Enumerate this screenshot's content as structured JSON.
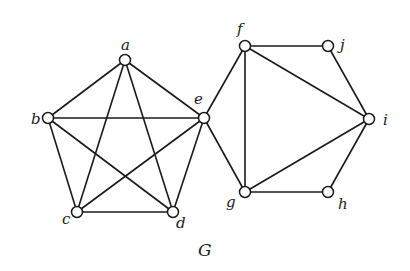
{
  "title": "G",
  "colors": {
    "edge": "#1a1a1a",
    "vertex_fill": "#ffffff",
    "vertex_stroke": "#1a1a1a",
    "label": "#222222"
  },
  "vertices": [
    {
      "id": "a",
      "label": "a",
      "x": 125,
      "y": 60,
      "lx": 121,
      "ly": 50
    },
    {
      "id": "b",
      "label": "b",
      "x": 48,
      "y": 118,
      "lx": 31,
      "ly": 124
    },
    {
      "id": "c",
      "label": "c",
      "x": 77,
      "y": 212,
      "lx": 62,
      "ly": 224
    },
    {
      "id": "d",
      "label": "d",
      "x": 173,
      "y": 212,
      "lx": 176,
      "ly": 228
    },
    {
      "id": "e",
      "label": "e",
      "x": 204,
      "y": 118,
      "lx": 194,
      "ly": 104
    },
    {
      "id": "f",
      "label": "f",
      "x": 245,
      "y": 46,
      "lx": 237,
      "ly": 34
    },
    {
      "id": "g",
      "label": "g",
      "x": 245,
      "y": 192,
      "lx": 226,
      "ly": 207
    },
    {
      "id": "h",
      "label": "h",
      "x": 328,
      "y": 192,
      "lx": 338,
      "ly": 209
    },
    {
      "id": "i",
      "label": "i",
      "x": 369,
      "y": 119,
      "lx": 383,
      "ly": 125
    },
    {
      "id": "j",
      "label": "j",
      "x": 328,
      "y": 46,
      "lx": 340,
      "ly": 50
    }
  ],
  "edges": [
    [
      "a",
      "b"
    ],
    [
      "a",
      "c"
    ],
    [
      "a",
      "d"
    ],
    [
      "a",
      "e"
    ],
    [
      "b",
      "c"
    ],
    [
      "b",
      "d"
    ],
    [
      "b",
      "e"
    ],
    [
      "c",
      "d"
    ],
    [
      "c",
      "e"
    ],
    [
      "d",
      "e"
    ],
    [
      "e",
      "f"
    ],
    [
      "e",
      "g"
    ],
    [
      "f",
      "g"
    ],
    [
      "f",
      "j"
    ],
    [
      "f",
      "i"
    ],
    [
      "g",
      "i"
    ],
    [
      "g",
      "h"
    ],
    [
      "j",
      "i"
    ],
    [
      "h",
      "i"
    ]
  ],
  "graph_label": {
    "text": "G",
    "x": 198,
    "y": 256
  }
}
